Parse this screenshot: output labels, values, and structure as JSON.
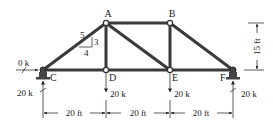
{
  "diagram": {
    "type": "truss",
    "nodes": {
      "A": {
        "label": "A",
        "x": 106,
        "y": 23
      },
      "B": {
        "label": "B",
        "x": 170,
        "y": 23
      },
      "C": {
        "label": "C",
        "x": 43,
        "y": 70
      },
      "D": {
        "label": "D",
        "x": 106,
        "y": 70
      },
      "E": {
        "label": "E",
        "x": 170,
        "y": 70
      },
      "F": {
        "label": "F",
        "x": 233,
        "y": 70
      }
    },
    "members": [
      [
        "C",
        "A"
      ],
      [
        "A",
        "B"
      ],
      [
        "B",
        "F"
      ],
      [
        "C",
        "D"
      ],
      [
        "D",
        "E"
      ],
      [
        "E",
        "F"
      ],
      [
        "A",
        "D"
      ],
      [
        "A",
        "E"
      ],
      [
        "B",
        "E"
      ]
    ],
    "slope": {
      "hyp": "5",
      "rise": "3",
      "run": "4"
    },
    "loads": {
      "C_horizontal": "0 k",
      "C_reaction": "20 k",
      "D_load": "20 k",
      "E_load": "20 k",
      "F_reaction": "20 k"
    },
    "dimensions": {
      "spans": [
        "20 ft",
        "20 ft",
        "20 ft"
      ],
      "height": "15 ft"
    }
  }
}
